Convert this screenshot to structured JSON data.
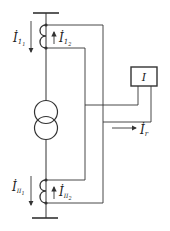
{
  "diagram": {
    "type": "transformer differential protection circuit",
    "colors": {
      "line": "#333333",
      "background": "#ffffff"
    },
    "labels": {
      "I11": {
        "main": "İ",
        "sub": "1",
        "subsub": "1"
      },
      "I12": {
        "main": "İ",
        "sub": "1",
        "subsub": "2"
      },
      "III1": {
        "main": "İ",
        "sub": "II",
        "subsub": "1"
      },
      "III2": {
        "main": "İ",
        "sub": "II",
        "subsub": "2"
      },
      "relay": "I",
      "Ir": {
        "main": "İ",
        "sub": "r"
      }
    },
    "components": [
      {
        "name": "top-busbar"
      },
      {
        "name": "top-current-transformer"
      },
      {
        "name": "power-transformer"
      },
      {
        "name": "bottom-current-transformer"
      },
      {
        "name": "bottom-busbar"
      },
      {
        "name": "differential-relay",
        "label": "I"
      }
    ]
  }
}
